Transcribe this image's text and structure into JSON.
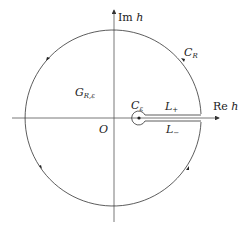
{
  "diagram": {
    "type": "keyhole-contour",
    "labels": {
      "im_axis_prefix": "Im",
      "im_axis_var": "h",
      "re_axis_prefix": "Re",
      "re_axis_var": "h",
      "big_arc_main": "C",
      "big_arc_sub": "R",
      "region_main": "G",
      "region_sub": "R,ε",
      "small_circle_main": "C",
      "small_circle_sub": "ε",
      "upper_segment_main": "L",
      "upper_segment_sub": "+",
      "lower_segment_main": "L",
      "lower_segment_sub": "−",
      "origin": "O"
    },
    "colors": {
      "stroke": "#333333",
      "axis": "#555555",
      "background": "#ffffff"
    }
  }
}
